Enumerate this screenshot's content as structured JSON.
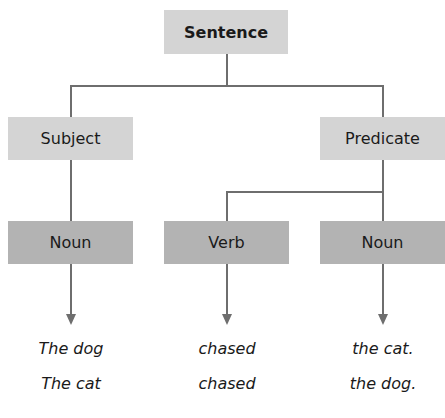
{
  "diagram": {
    "title": "Sentence",
    "level1": {
      "subject": "Subject",
      "predicate": "Predicate"
    },
    "level2": {
      "noun_left": "Noun",
      "verb": "Verb",
      "noun_right": "Noun"
    },
    "examples": [
      {
        "subject": "The dog",
        "verb": "chased",
        "object": "the cat."
      },
      {
        "subject": "The cat",
        "verb": "chased",
        "object": "the dog."
      }
    ],
    "colors": {
      "upper_box": "#d4d4d4",
      "lower_box": "#b3b3b3",
      "line": "#6e6e6e"
    }
  }
}
